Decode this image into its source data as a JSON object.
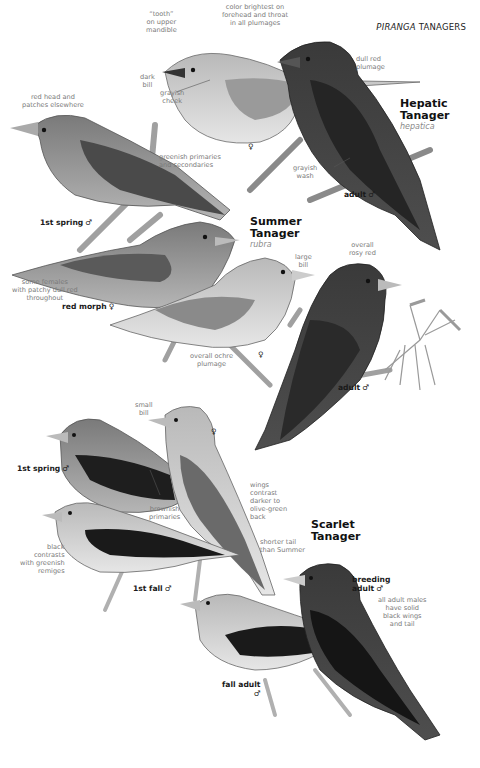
{
  "page": {
    "header_italic": "PIRANGA",
    "header_rest": " TANAGERS"
  },
  "species": {
    "hepatic": {
      "name_line1": "Hepatic",
      "name_line2": "Tanager",
      "latin": "hepatica"
    },
    "summer": {
      "name_line1": "Summer",
      "name_line2": "Tanager",
      "latin": "rubra"
    },
    "scarlet": {
      "name_line1": "Scarlet",
      "name_line2": "Tanager"
    }
  },
  "labels": {
    "hepatic_female": "♀",
    "hepatic_adult_male": "adult",
    "hepatic_adult_male_sym": "♂",
    "summer_1st_spring_male": "1st spring",
    "summer_1st_spring_male_sym": "♂",
    "summer_red_morph_female": "red morph",
    "summer_red_morph_female_sym": "♀",
    "summer_female": "♀",
    "summer_adult_male": "adult",
    "summer_adult_male_sym": "♂",
    "scarlet_1st_spring_male": "1st spring",
    "scarlet_1st_spring_male_sym": "♂",
    "scarlet_female": "♀",
    "scarlet_1st_fall_male": "1st fall",
    "scarlet_1st_fall_male_sym": "♂",
    "scarlet_breeding_adult_line1": "breeding",
    "scarlet_breeding_adult_line2": "adult",
    "scarlet_breeding_adult_sym": "♂",
    "scarlet_fall_adult": "fall adult",
    "scarlet_fall_adult_sym": "♂"
  },
  "notes": {
    "tooth": [
      "“tooth”",
      "on upper",
      "mandible"
    ],
    "color_brightest": [
      "color brightest on",
      "forehead and throat",
      "in all plumages"
    ],
    "dull_red": [
      "dull red",
      "plumage"
    ],
    "dark_bill": [
      "dark",
      "bill"
    ],
    "grayish_cheek": [
      "grayish",
      "cheek"
    ],
    "red_head": [
      "red head and",
      "patches elsewhere"
    ],
    "greenish_primaries": [
      "greenish primaries",
      "and secondaries"
    ],
    "grayish_wash": [
      "grayish",
      "wash"
    ],
    "some_females": [
      "some females",
      "with patchy dull red",
      "throughout"
    ],
    "large_bill": [
      "large",
      "bill"
    ],
    "overall_rosy": [
      "overall",
      "rosy red"
    ],
    "overall_ochre": [
      "overall ochre",
      "plumage"
    ],
    "small_bill": [
      "small",
      "bill"
    ],
    "brownish_primaries": [
      "brownish",
      "primaries"
    ],
    "wings_contrast": [
      "wings",
      "contrast",
      "darker to",
      "olive-green",
      "back"
    ],
    "shorter_tail": [
      "shorter tail",
      "than Summer"
    ],
    "black_contrasts": [
      "black",
      "contrasts",
      "with greenish",
      "remiges"
    ],
    "all_adult_males": [
      "all adult males",
      "have solid",
      "black wings",
      "and tail"
    ]
  },
  "colors": {
    "text_note": "#7a7a7a",
    "text_label": "#1a1a1a",
    "latin": "#8a8a8a",
    "bird_dark": "#2e2e2e",
    "bird_mid": "#8c8c8c",
    "bird_light": "#c9c9c9",
    "branch": "#9a9a9a"
  }
}
